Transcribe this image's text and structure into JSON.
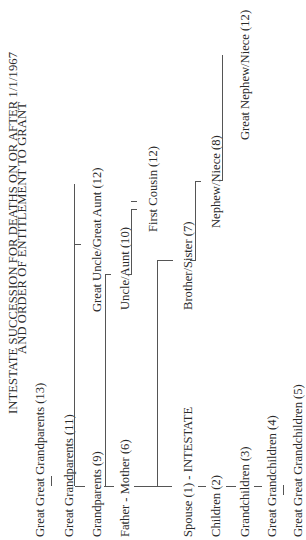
{
  "title": {
    "line1": "INTESTATE SUCCESSION FOR DEATHS ON OR AFTER 1/1/1967",
    "line2": "AND ORDER OF ENTITLEMENT TO GRANT"
  },
  "ascendants": [
    {
      "label": "Great Great Grandparents (13)"
    },
    {
      "label": "Great Grandparents (11)"
    },
    {
      "label": "Grandparents (9)"
    },
    {
      "label": "Father - Mother (6)"
    }
  ],
  "intestate": {
    "label": "Spouse (1) - INTESTATE"
  },
  "descendants": [
    {
      "label": "Children (2)"
    },
    {
      "label": "Grandchildren (3)"
    },
    {
      "label": "Great Grandchildren (4)"
    },
    {
      "label": "Great Great Grandchildren (5)"
    }
  ],
  "collaterals": [
    {
      "label": "Great Uncle/Great Aunt (12)"
    },
    {
      "label": "Uncle/Aunt (10)"
    },
    {
      "label": "First Cousin (12)"
    },
    {
      "label": "Brother/Sister (7)"
    },
    {
      "label": "Nephew/Niece (8)"
    },
    {
      "label": "Great Nephew/Niece (12)"
    }
  ],
  "colors": {
    "line": "#555555",
    "text": "#2a2a2a",
    "background": "#ffffff"
  }
}
